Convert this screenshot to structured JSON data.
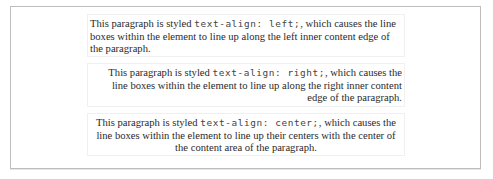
{
  "paragraphs": [
    {
      "align": "left",
      "before": "This paragraph is styled ",
      "code": "text-align: left;",
      "after": ", which causes the line boxes within the element to line up along the left inner content edge of the paragraph."
    },
    {
      "align": "right",
      "before": "This paragraph is styled ",
      "code": "text-align: right;",
      "after": ", which causes the line boxes within the element to line up along the right inner content edge of the paragraph."
    },
    {
      "align": "center",
      "before": "This paragraph is styled ",
      "code": "text-align: center;",
      "after": ", which causes the line boxes within the element to line up their centers with the center of the content area of the paragraph."
    }
  ]
}
